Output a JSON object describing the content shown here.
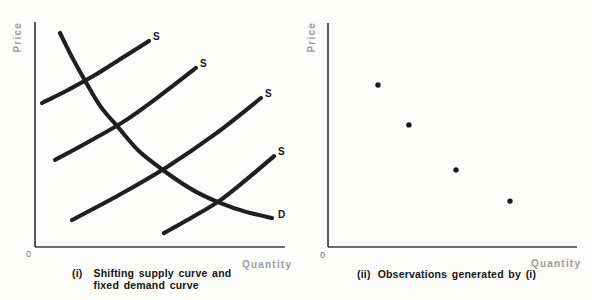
{
  "figure": {
    "background": "#fcfcfa",
    "colors": {
      "curve": "#1f1f1f",
      "dot": "#1a1a1a",
      "axis": "#3d3d3d",
      "muted_label": "#9c9c9c",
      "origin_label": "#777777",
      "caption": "#161616"
    }
  },
  "chart_data": [
    {
      "type": "line",
      "panel_label": "i",
      "title": "(i) Shifting supply curve and fixed demand curve",
      "ylabel": "Price",
      "xlabel": "Quantity",
      "origin": "0",
      "axis_tick_labels": "none (only 0 at origin)",
      "caption": {
        "prefix": "(i)",
        "line1": "Shifting supply curve and",
        "line2": "fixed demand curve"
      },
      "series": [
        {
          "name": "demand-curve",
          "label": "D",
          "points": [
            [
              0.1,
              0.951
            ],
            [
              0.148,
              0.844
            ],
            [
              0.208,
              0.724
            ],
            [
              0.264,
              0.622
            ],
            [
              0.332,
              0.533
            ],
            [
              0.42,
              0.422
            ],
            [
              0.528,
              0.329
            ],
            [
              0.632,
              0.253
            ],
            [
              0.74,
              0.196
            ],
            [
              0.844,
              0.156
            ],
            [
              0.948,
              0.129
            ]
          ]
        },
        {
          "name": "supply-curve-1",
          "label": "S",
          "points": [
            [
              0.028,
              0.64
            ],
            [
              0.132,
              0.698
            ],
            [
              0.24,
              0.764
            ],
            [
              0.348,
              0.84
            ],
            [
              0.456,
              0.916
            ]
          ]
        },
        {
          "name": "supply-curve-2",
          "label": "S",
          "points": [
            [
              0.08,
              0.387
            ],
            [
              0.22,
              0.471
            ],
            [
              0.364,
              0.564
            ],
            [
              0.504,
              0.676
            ],
            [
              0.644,
              0.796
            ]
          ]
        },
        {
          "name": "supply-curve-3",
          "label": "S",
          "points": [
            [
              0.148,
              0.12
            ],
            [
              0.336,
              0.231
            ],
            [
              0.528,
              0.356
            ],
            [
              0.716,
              0.498
            ],
            [
              0.904,
              0.662
            ]
          ]
        },
        {
          "name": "supply-curve-4",
          "label": "S",
          "points": [
            [
              0.516,
              0.062
            ],
            [
              0.624,
              0.129
            ],
            [
              0.736,
              0.204
            ],
            [
              0.844,
              0.298
            ],
            [
              0.956,
              0.404
            ]
          ]
        }
      ],
      "intersections_axis_fraction": [
        [
          0.208,
          0.724
        ],
        [
          0.332,
          0.533
        ],
        [
          0.528,
          0.329
        ],
        [
          0.74,
          0.196
        ]
      ]
    },
    {
      "type": "scatter",
      "panel_label": "ii",
      "title": "(ii) Observations generated by (i)",
      "ylabel": "Price",
      "xlabel": "Quantity",
      "origin": "0",
      "axis_tick_labels": "none (only 0 at origin)",
      "caption": {
        "prefix": "(ii)",
        "line1": "Observations generated by (i)"
      },
      "points": [
        [
          0.201,
          0.723
        ],
        [
          0.325,
          0.545
        ],
        [
          0.514,
          0.344
        ],
        [
          0.731,
          0.205
        ]
      ]
    }
  ]
}
